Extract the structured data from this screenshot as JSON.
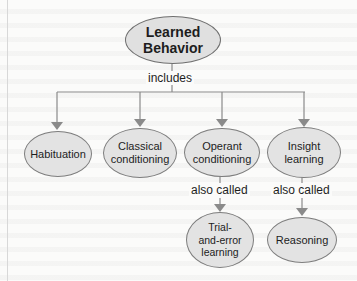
{
  "diagram": {
    "type": "concept-map",
    "root": {
      "label": "Learned Behavior"
    },
    "root_link": "includes",
    "children": [
      {
        "label": "Habituation"
      },
      {
        "label": "Classical conditioning"
      },
      {
        "label": "Operant conditioning",
        "link": "also called",
        "child": {
          "label": "Trial-and-error learning"
        }
      },
      {
        "label": "Insight learning",
        "link": "also called",
        "child": {
          "label": "Reasoning"
        }
      }
    ],
    "colors": {
      "node_fill": "#e3e3e3",
      "node_border": "#7d7d7d",
      "line": "#8a8a8a",
      "text": "#1d1d1d"
    }
  },
  "text": {
    "root_line1": "Learned",
    "root_line2": "Behavior",
    "includes": "includes",
    "habituation": "Habituation",
    "classical_line1": "Classical",
    "classical_line2": "conditioning",
    "operant_line1": "Operant",
    "operant_line2": "conditioning",
    "insight_line1": "Insight",
    "insight_line2": "learning",
    "also_called_1": "also called",
    "also_called_2": "also called",
    "trial_line1": "Trial-",
    "trial_line2": "and-error",
    "trial_line3": "learning",
    "reasoning": "Reasoning"
  }
}
